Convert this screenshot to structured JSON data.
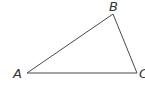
{
  "diagram": {
    "type": "triangle",
    "vertices": [
      {
        "id": "A",
        "label": "A",
        "x": 27,
        "y": 73,
        "label_x": 13,
        "label_y": 78
      },
      {
        "id": "B",
        "label": "B",
        "x": 113,
        "y": 14,
        "label_x": 109,
        "label_y": 11
      },
      {
        "id": "C",
        "label": "C",
        "x": 137,
        "y": 73,
        "label_x": 139,
        "label_y": 78
      }
    ],
    "edges": [
      {
        "from": "A",
        "to": "B"
      },
      {
        "from": "B",
        "to": "C"
      },
      {
        "from": "C",
        "to": "A"
      }
    ],
    "colors": {
      "stroke": "#4a4a4a",
      "label": "#333333",
      "background": "#ffffff"
    }
  }
}
